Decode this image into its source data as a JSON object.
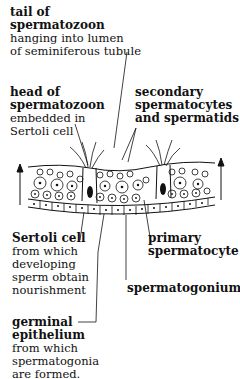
{
  "labels": {
    "tail": {
      "title_1": "tail of",
      "title_2": "spermatozoon",
      "desc_1": "hanging into lumen",
      "desc_2": "of seminiferous tubule"
    },
    "head": {
      "title_1": "head of",
      "title_2": "spermatozoon",
      "desc_1": "embedded in",
      "desc_2": "Sertoli cell"
    },
    "secondary": {
      "title_1": "secondary",
      "title_2": "spermatocytes",
      "title_3": "and spermatids"
    },
    "sertoli": {
      "title_1": "Sertoli cell",
      "desc_1": "from which",
      "desc_2": "developing",
      "desc_3": "sperm obtain",
      "desc_4": "nourishment"
    },
    "primary": {
      "title_1": "primary",
      "title_2": "spermatocyte"
    },
    "spermatogonium": {
      "title_1": "spermatogonium"
    },
    "germinal": {
      "title_1": "germinal",
      "title_2": "epithelium",
      "desc_1": "from which",
      "desc_2": "spermatogonia",
      "desc_3": "are formed."
    }
  },
  "diagram": {
    "arrows": [
      "left-up-arrow",
      "right-up-arrow"
    ]
  }
}
